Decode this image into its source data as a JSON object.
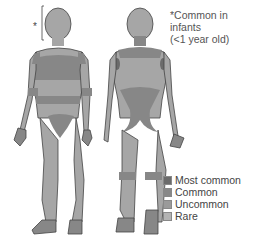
{
  "diagram": {
    "figures": [
      "front-view",
      "back-view"
    ],
    "annotation": {
      "marker": "*",
      "lines": [
        "*Common in",
        "infants",
        "(<1 year old)"
      ]
    },
    "legend": [
      {
        "label": "Most common",
        "color": "#6b6b6b"
      },
      {
        "label": "Common",
        "color": "#888888"
      },
      {
        "label": "Uncommon",
        "color": "#9a9a9a"
      },
      {
        "label": "Rare",
        "color": "#b3b3b3"
      }
    ],
    "colors": {
      "skin_base": "#a6a6a6",
      "outline": "#444444",
      "common_band": "#878787",
      "most_common": "#6b6b6b"
    }
  }
}
